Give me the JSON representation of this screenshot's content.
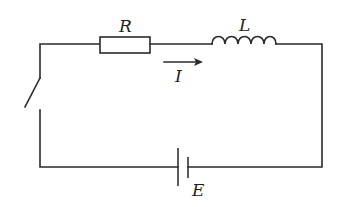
{
  "diagram": {
    "type": "circuit",
    "components": {
      "resistor": {
        "label": "R"
      },
      "inductor": {
        "label": "L"
      },
      "current": {
        "label": "I",
        "direction": "right"
      },
      "battery": {
        "label": "E"
      },
      "switch": {
        "state": "open"
      }
    },
    "colors": {
      "line": "#2a2a2a",
      "background": "#ffffff"
    }
  }
}
